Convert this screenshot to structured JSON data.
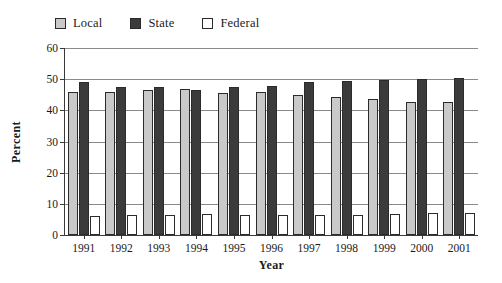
{
  "chart_data": {
    "type": "bar",
    "title": "",
    "xlabel": "Year",
    "ylabel": "Percent",
    "categories": [
      "1991",
      "1992",
      "1993",
      "1994",
      "1995",
      "1996",
      "1997",
      "1998",
      "1999",
      "2000",
      "2001"
    ],
    "series": [
      {
        "name": "Local",
        "color": "#c9c9c9",
        "values": [
          46.0,
          46.0,
          46.4,
          46.8,
          45.6,
          45.8,
          45.0,
          44.3,
          43.8,
          42.8,
          42.7
        ]
      },
      {
        "name": "State",
        "color": "#3b3b3b",
        "values": [
          49.0,
          47.6,
          47.6,
          46.6,
          47.5,
          47.7,
          49.0,
          49.5,
          49.7,
          50.2,
          50.4
        ]
      },
      {
        "name": "Federal",
        "color": "#ffffff",
        "values": [
          6.2,
          6.3,
          6.5,
          6.7,
          6.5,
          6.3,
          6.3,
          6.5,
          6.8,
          7.2,
          7.0
        ]
      }
    ],
    "ylim": [
      0,
      60
    ],
    "yticks": [
      "0",
      "10",
      "20",
      "30",
      "40",
      "50",
      "60"
    ],
    "grid": true,
    "legend_position": "top-left"
  },
  "legend": {
    "items": [
      {
        "label": "Local",
        "swatch": "legend-swatch-local"
      },
      {
        "label": "State",
        "swatch": "legend-swatch-state"
      },
      {
        "label": "Federal",
        "swatch": "legend-swatch-federal"
      }
    ]
  },
  "axes": {
    "y_title": "Percent",
    "x_title": "Year"
  }
}
